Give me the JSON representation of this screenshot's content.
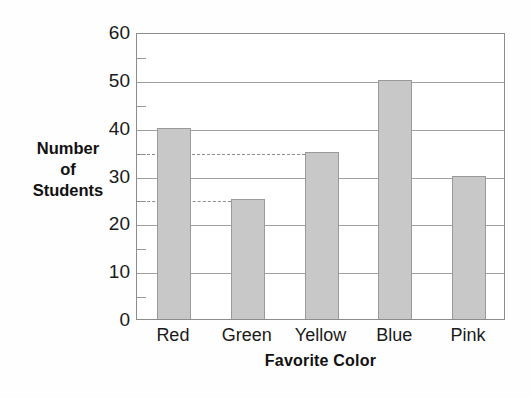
{
  "chart_data": {
    "type": "bar",
    "title": "",
    "xlabel": "Favorite Color",
    "ylabel": "Number of Students",
    "categories": [
      "Red",
      "Green",
      "Yellow",
      "Blue",
      "Pink"
    ],
    "values": [
      40,
      25,
      35,
      50,
      30
    ],
    "ylim": [
      0,
      60
    ],
    "y_major_ticks": [
      0,
      10,
      20,
      30,
      40,
      50,
      60
    ],
    "y_minor_ticks": [
      5,
      15,
      25,
      35,
      45,
      55
    ],
    "y_tick_labels": [
      "0",
      "10",
      "20",
      "30",
      "40",
      "50",
      "60"
    ],
    "grid": "horizontal",
    "legend": "none",
    "bar_color": "#c8c8c8",
    "bar_edge_color": "#9a9a9a",
    "grid_color": "#a0a0a0",
    "axis_color": "#8c8c8c",
    "background_color": "#ffffff",
    "annotations": [
      {
        "kind": "dashed-reference-line",
        "value": 35,
        "label": "35",
        "extends_to_category": "Yellow",
        "style": "dashed",
        "color": "#8e8e8e"
      },
      {
        "kind": "dashed-reference-line",
        "value": 25,
        "label": "25",
        "extends_to_category": "Green",
        "style": "dashed",
        "color": "#8e8e8e"
      }
    ]
  },
  "axis_titles": {
    "y_line1": "Number",
    "y_line2": "of",
    "y_line3": "Students",
    "x": "Favorite Color"
  },
  "artifact": {
    "bleed_line1": "                    ",
    "bleed_line2": "            "
  }
}
